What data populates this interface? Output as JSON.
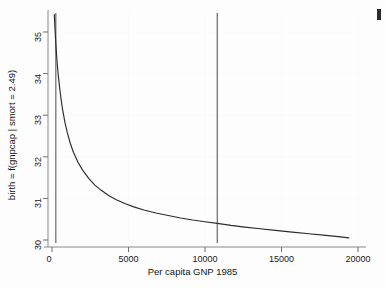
{
  "chart_data": {
    "type": "line",
    "title": "",
    "subtitle": "",
    "xlabel": "Per capita GNP 1985",
    "ylabel": "birth = f(gnpcap | smort = 2.49)",
    "xlim": [
      0,
      20000
    ],
    "ylim": [
      30,
      35.5
    ],
    "xticks": [
      0,
      5000,
      10000,
      15000,
      20000
    ],
    "xtick_labels": [
      "0",
      "5000",
      "10000",
      "15000",
      "20000"
    ],
    "yticks": [
      30,
      31,
      32,
      33,
      34,
      35
    ],
    "ytick_labels": [
      "30",
      "31",
      "32",
      "33",
      "34",
      "35"
    ],
    "grid": false,
    "legend": "none",
    "series": [
      {
        "name": "birth = f(gnpcap | smort = 2.49)",
        "color": "#2b2b2b",
        "x": [
          150,
          200,
          250,
          300,
          350,
          420,
          500,
          600,
          700,
          850,
          1000,
          1200,
          1400,
          1700,
          2000,
          2400,
          2800,
          3200,
          3700,
          4200,
          4800,
          5400,
          6000,
          6800,
          7600,
          8400,
          9200,
          10000,
          10800,
          11700,
          12600,
          13600,
          14600,
          15700,
          16800,
          17900,
          18700,
          19400
        ],
        "y": [
          35.42,
          35.05,
          34.72,
          34.44,
          34.2,
          33.92,
          33.66,
          33.36,
          33.12,
          32.82,
          32.58,
          32.32,
          32.11,
          31.87,
          31.68,
          31.48,
          31.32,
          31.2,
          31.07,
          30.97,
          30.87,
          30.79,
          30.72,
          30.65,
          30.59,
          30.53,
          30.48,
          30.44,
          30.4,
          30.35,
          30.31,
          30.27,
          30.23,
          30.19,
          30.15,
          30.11,
          30.08,
          30.05
        ]
      }
    ],
    "reference_lines": [
      {
        "name": "gnpcap-lower-reference",
        "orientation": "vertical",
        "x": 250,
        "color": "#5a5a5a"
      },
      {
        "name": "gnpcap-upper-reference",
        "orientation": "vertical",
        "x": 10800,
        "color": "#5a5a5a"
      }
    ],
    "annotations": []
  },
  "axes": {
    "y_title": "birth = f(gnpcap | smort = 2.49)",
    "x_title": "Per capita GNP 1985",
    "y_labels": [
      "35",
      "34",
      "33",
      "32",
      "31",
      "30"
    ],
    "x_labels": [
      "0",
      "5000",
      "10000",
      "15000",
      "20000"
    ]
  }
}
